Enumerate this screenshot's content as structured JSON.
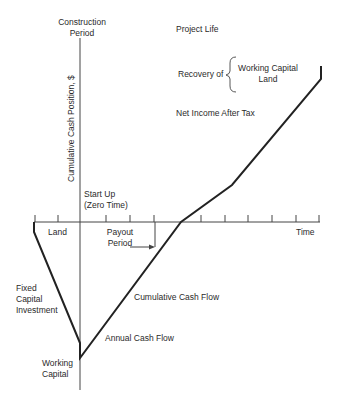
{
  "diagram": {
    "type": "cumulative-cash-flow",
    "labels": {
      "construction_period_1": "Construction",
      "construction_period_2": "Period",
      "project_life": "Project Life",
      "recovery_of": "Recovery of",
      "recovery_item_1": "Working Capital",
      "recovery_item_2": "Land",
      "net_income": "Net Income After Tax",
      "y_axis": "Cumulative Cash Position, $",
      "start_up_1": "Start Up",
      "start_up_2": "(Zero Time)",
      "land": "Land",
      "payout_1": "Payout",
      "payout_2": "Period",
      "time": "Time",
      "fixed_capital_1": "Fixed",
      "fixed_capital_2": "Capital",
      "fixed_capital_3": "Investment",
      "cumulative_cash_flow": "Cumulative Cash Flow",
      "annual_cash_flow": "Annual Cash Flow",
      "working_capital_1": "Working",
      "working_capital_2": "Capital"
    },
    "line_color": "#222222"
  }
}
